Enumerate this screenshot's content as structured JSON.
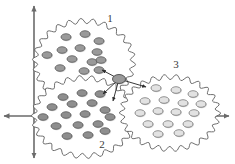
{
  "figure": {
    "type": "scatter-cluster-diagram",
    "background_color": "#ffffff",
    "width": 235,
    "height": 164
  },
  "axes": {
    "name": "cartesian-axes",
    "stroke_color": "#6b6b6b",
    "origin": {
      "x": 34,
      "y": 116
    },
    "vertical": {
      "x": 34,
      "y_top": 6,
      "y_bottom": 158,
      "arrow_top": true,
      "arrow_bottom": true
    },
    "horizontal": {
      "y": 116,
      "x_left": 4,
      "x_right": 229,
      "arrow_left": true,
      "arrow_right": true
    }
  },
  "clusters": [
    {
      "id": "cluster-1",
      "label": "1",
      "label_x": 110,
      "label_y": 22,
      "center_x": 84,
      "center_y": 62,
      "radius_x": 49,
      "radius_y": 41,
      "outline_color": "#555555",
      "point_fill": "#9a9a9a",
      "point_stroke": "#4a4a4a",
      "point_style": "filled-gray",
      "points": [
        {
          "x": 66,
          "y": 37
        },
        {
          "x": 85,
          "y": 34
        },
        {
          "x": 99,
          "y": 41
        },
        {
          "x": 62,
          "y": 50
        },
        {
          "x": 80,
          "y": 48
        },
        {
          "x": 97,
          "y": 52
        },
        {
          "x": 47,
          "y": 55
        },
        {
          "x": 72,
          "y": 59
        },
        {
          "x": 92,
          "y": 62
        },
        {
          "x": 60,
          "y": 68
        },
        {
          "x": 84,
          "y": 71
        },
        {
          "x": 101,
          "y": 60
        },
        {
          "x": 99,
          "y": 70
        }
      ],
      "hub_link_point": {
        "x": 99,
        "y": 70
      }
    },
    {
      "id": "cluster-2",
      "label": "2",
      "label_x": 102,
      "label_y": 148,
      "center_x": 84,
      "center_y": 117,
      "radius_x": 50,
      "radius_y": 39,
      "outline_color": "#555555",
      "point_fill": "#8e8e8e",
      "point_stroke": "#4a4a4a",
      "point_style": "filled-gray",
      "points": [
        {
          "x": 63,
          "y": 97
        },
        {
          "x": 82,
          "y": 93
        },
        {
          "x": 100,
          "y": 94
        },
        {
          "x": 52,
          "y": 107
        },
        {
          "x": 72,
          "y": 104
        },
        {
          "x": 92,
          "y": 103
        },
        {
          "x": 43,
          "y": 117
        },
        {
          "x": 66,
          "y": 115
        },
        {
          "x": 85,
          "y": 114
        },
        {
          "x": 105,
          "y": 110
        },
        {
          "x": 110,
          "y": 117
        },
        {
          "x": 56,
          "y": 126
        },
        {
          "x": 78,
          "y": 125
        },
        {
          "x": 98,
          "y": 124
        },
        {
          "x": 67,
          "y": 136
        },
        {
          "x": 88,
          "y": 135
        },
        {
          "x": 105,
          "y": 131
        }
      ],
      "hub_link_points": [
        {
          "x": 100,
          "y": 94
        },
        {
          "x": 110,
          "y": 104
        }
      ]
    },
    {
      "id": "cluster-3",
      "label": "3",
      "label_x": 176,
      "label_y": 68,
      "center_x": 170,
      "center_y": 113,
      "radius_x": 48,
      "radius_y": 36,
      "outline_color": "#555555",
      "point_fill": "#e2e2e2",
      "point_stroke": "#6a6a6a",
      "point_style": "hollow-light",
      "points": [
        {
          "x": 156,
          "y": 88
        },
        {
          "x": 176,
          "y": 90
        },
        {
          "x": 193,
          "y": 94
        },
        {
          "x": 145,
          "y": 101
        },
        {
          "x": 164,
          "y": 100
        },
        {
          "x": 183,
          "y": 103
        },
        {
          "x": 201,
          "y": 104
        },
        {
          "x": 140,
          "y": 113
        },
        {
          "x": 158,
          "y": 111
        },
        {
          "x": 176,
          "y": 112
        },
        {
          "x": 194,
          "y": 113
        },
        {
          "x": 148,
          "y": 124
        },
        {
          "x": 168,
          "y": 124
        },
        {
          "x": 188,
          "y": 124
        },
        {
          "x": 158,
          "y": 134
        },
        {
          "x": 179,
          "y": 133
        }
      ],
      "hub_link_point": {
        "x": 148,
        "y": 88
      }
    }
  ],
  "hub": {
    "name": "central-hub-node",
    "x": 119,
    "y": 79,
    "fill": "#9a9a9a",
    "stroke": "#3a3a3a",
    "radius_x": 6.5,
    "radius_y": 4.5
  },
  "arrows": [
    {
      "id": "arrow-to-cluster-1",
      "from_x": 119,
      "from_y": 79,
      "to_x": 102,
      "to_y": 70,
      "target": "cluster-1"
    },
    {
      "id": "arrow-to-cluster-2-a",
      "from_x": 119,
      "from_y": 79,
      "to_x": 103,
      "to_y": 94,
      "target": "cluster-2"
    },
    {
      "id": "arrow-to-cluster-2-b",
      "from_x": 119,
      "from_y": 79,
      "to_x": 113,
      "to_y": 101,
      "target": "cluster-2"
    },
    {
      "id": "arrow-to-cluster-3",
      "from_x": 119,
      "from_y": 79,
      "to_x": 146,
      "to_y": 87,
      "target": "cluster-3"
    }
  ],
  "colors": {
    "axis": "#6b6b6b",
    "outline": "#555555",
    "dark_point": "#9a9a9a",
    "light_point": "#e2e2e2",
    "label_text": "#3a3a3a",
    "arrow": "#2e2e2e"
  }
}
